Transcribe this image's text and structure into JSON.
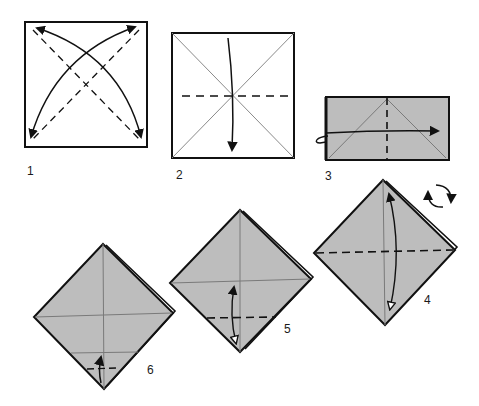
{
  "diagram": {
    "colors": {
      "paper_white": "#ffffff",
      "paper_gray": "#bdbdbd",
      "outline": "#111111",
      "crease": "#7a7a7a"
    },
    "steps": [
      {
        "number": "1",
        "description": "Square with both diagonal valley folds; arrows fold corners and unfold"
      },
      {
        "number": "2",
        "description": "Square with diagonal creases; horizontal valley fold, fold top down"
      },
      {
        "number": "3",
        "description": "Rectangle with vertical center valley fold; fold behind to the right"
      },
      {
        "number": "4",
        "description": "Diamond with horizontal valley fold; fold bottom up and unfold; rotate"
      },
      {
        "number": "5",
        "description": "Diamond with lower dashed fold; fold point up and unfold"
      },
      {
        "number": "6",
        "description": "Diamond with small fold at bottom point; fold up"
      }
    ]
  }
}
